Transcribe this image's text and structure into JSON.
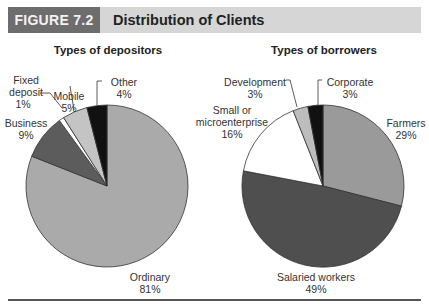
{
  "figure": {
    "label": "FIGURE 7.2",
    "title": "Distribution of Clients"
  },
  "colors": {
    "header_label_bg": "#6d6d6d",
    "header_bar_bg": "#d6d6d6",
    "ordinary": "#aaaaaa",
    "business": "#5c5c5c",
    "fixed_deposit": "#ffffff",
    "mobile": "#c4c4c4",
    "other": "#111111",
    "farmers": "#9a9a9a",
    "salaried": "#4f4f4f",
    "small": "#ffffff",
    "development": "#bdbdbd",
    "corporate": "#111111"
  },
  "chart_data": [
    {
      "type": "pie",
      "title": "Types of depositors",
      "categories": [
        "Ordinary",
        "Business",
        "Fixed deposit",
        "Mobile",
        "Other"
      ],
      "values": [
        81,
        9,
        1,
        5,
        4
      ],
      "unit": "%",
      "labels": [
        {
          "name": "Ordinary",
          "value": "81%"
        },
        {
          "name": "Business",
          "value": "9%"
        },
        {
          "name": "Fixed deposit",
          "line1": "Fixed",
          "line2": "deposit",
          "value": "1%"
        },
        {
          "name": "Mobile",
          "value": "5%"
        },
        {
          "name": "Other",
          "value": "4%"
        }
      ]
    },
    {
      "type": "pie",
      "title": "Types of borrowers",
      "categories": [
        "Farmers",
        "Salaried workers",
        "Small or microenterprise",
        "Development",
        "Corporate"
      ],
      "values": [
        29,
        49,
        16,
        3,
        3
      ],
      "unit": "%",
      "labels": [
        {
          "name": "Farmers",
          "value": "29%"
        },
        {
          "name": "Salaried workers",
          "value": "49%"
        },
        {
          "name": "Small or microenterprise",
          "line1": "Small or",
          "line2": "microenterprise",
          "value": "16%"
        },
        {
          "name": "Development",
          "value": "3%"
        },
        {
          "name": "Corporate",
          "value": "3%"
        }
      ]
    }
  ]
}
